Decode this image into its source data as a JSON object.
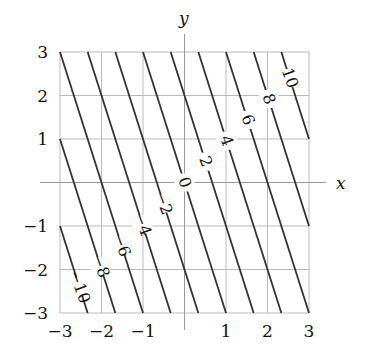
{
  "chart_data": {
    "type": "contour",
    "function": "f(x,y) = 3x + y",
    "title": "",
    "xlabel": "x",
    "ylabel": "y",
    "xlim": [
      -3,
      3
    ],
    "ylim": [
      -3,
      3
    ],
    "grid": true,
    "x_ticks": [
      "-3",
      "-2",
      "-1",
      "1",
      "2",
      "3"
    ],
    "y_ticks": [
      "3",
      "2",
      "1",
      "-1",
      "-2",
      "-3"
    ],
    "contour_levels": [
      -12,
      -10,
      -8,
      -6,
      -4,
      -2,
      0,
      2,
      4,
      6,
      8,
      10,
      12
    ],
    "labeled_levels": [
      "-10",
      "-8",
      "-6",
      "-4",
      "-2",
      "0",
      "2",
      "4",
      "6",
      "8",
      "10"
    ],
    "line_color": "#333333",
    "grid_color": "#bbbbbb"
  }
}
